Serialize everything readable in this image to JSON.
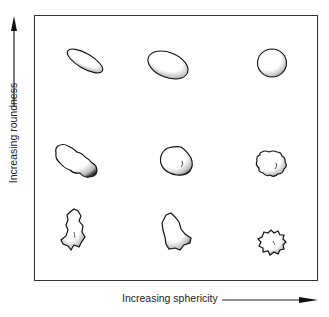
{
  "diagram": {
    "type": "grain-shape-classification-grid",
    "x_axis": {
      "label": "Increasing sphericity",
      "direction": "right"
    },
    "y_axis": {
      "label": "Increasing roundness",
      "direction": "up"
    },
    "grid": {
      "rows": 3,
      "cols": 3,
      "cells": [
        {
          "row": 1,
          "col": 1,
          "shape": "elongated smooth ellipse",
          "roundness": "high",
          "sphericity": "low"
        },
        {
          "row": 1,
          "col": 2,
          "shape": "smooth oval",
          "roundness": "high",
          "sphericity": "medium"
        },
        {
          "row": 1,
          "col": 3,
          "shape": "smooth sphere",
          "roundness": "high",
          "sphericity": "high"
        },
        {
          "row": 2,
          "col": 1,
          "shape": "elongated subrounded grain",
          "roundness": "medium",
          "sphericity": "low"
        },
        {
          "row": 2,
          "col": 2,
          "shape": "subrounded grain",
          "roundness": "medium",
          "sphericity": "medium"
        },
        {
          "row": 2,
          "col": 3,
          "shape": "equant subrounded grain",
          "roundness": "medium",
          "sphericity": "high"
        },
        {
          "row": 3,
          "col": 1,
          "shape": "elongated angular grain",
          "roundness": "low",
          "sphericity": "low"
        },
        {
          "row": 3,
          "col": 2,
          "shape": "angular grain",
          "roundness": "low",
          "sphericity": "medium"
        },
        {
          "row": 3,
          "col": 3,
          "shape": "equant angular grain",
          "roundness": "low",
          "sphericity": "high"
        }
      ]
    },
    "colors": {
      "line": "#222222",
      "background": "#ffffff"
    }
  }
}
